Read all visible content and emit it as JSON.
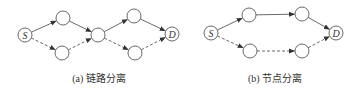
{
  "panels": [
    {
      "id": "a",
      "caption": "(a) 链路分离",
      "caption_x": 99,
      "nodes": [
        {
          "id": "S",
          "label": "S",
          "x": 25,
          "y": 35
        },
        {
          "id": "a1",
          "label": "",
          "x": 63,
          "y": 18
        },
        {
          "id": "a2",
          "label": "",
          "x": 62,
          "y": 53
        },
        {
          "id": "m",
          "label": "",
          "x": 98,
          "y": 35
        },
        {
          "id": "a3",
          "label": "",
          "x": 134,
          "y": 16
        },
        {
          "id": "a4",
          "label": "",
          "x": 135,
          "y": 53
        },
        {
          "id": "D",
          "label": "D",
          "x": 172,
          "y": 34
        }
      ],
      "edges": [
        {
          "from": "S",
          "to": "a1",
          "style": "solid"
        },
        {
          "from": "a1",
          "to": "m",
          "style": "solid"
        },
        {
          "from": "m",
          "to": "a3",
          "style": "solid"
        },
        {
          "from": "a3",
          "to": "D",
          "style": "solid"
        },
        {
          "from": "S",
          "to": "a2",
          "style": "dashed"
        },
        {
          "from": "a2",
          "to": "m",
          "style": "dashed"
        },
        {
          "from": "m",
          "to": "a4",
          "style": "dashed"
        },
        {
          "from": "a4",
          "to": "D",
          "style": "dashed"
        }
      ]
    },
    {
      "id": "b",
      "caption": "(b) 节点分离",
      "caption_x": 275,
      "nodes": [
        {
          "id": "S",
          "label": "S",
          "x": 211,
          "y": 33
        },
        {
          "id": "b1",
          "label": "",
          "x": 249,
          "y": 15
        },
        {
          "id": "b2",
          "label": "",
          "x": 250,
          "y": 51
        },
        {
          "id": "b3",
          "label": "",
          "x": 302,
          "y": 14
        },
        {
          "id": "b4",
          "label": "",
          "x": 302,
          "y": 51
        },
        {
          "id": "D",
          "label": "D",
          "x": 336,
          "y": 33
        }
      ],
      "edges": [
        {
          "from": "S",
          "to": "b1",
          "style": "solid"
        },
        {
          "from": "b1",
          "to": "b3",
          "style": "solid"
        },
        {
          "from": "b3",
          "to": "D",
          "style": "solid"
        },
        {
          "from": "S",
          "to": "b2",
          "style": "dashed"
        },
        {
          "from": "b2",
          "to": "b4",
          "style": "dashed"
        },
        {
          "from": "b4",
          "to": "D",
          "style": "dashed"
        }
      ]
    }
  ],
  "style": {
    "stroke": "#444444",
    "node_radius": 7
  }
}
